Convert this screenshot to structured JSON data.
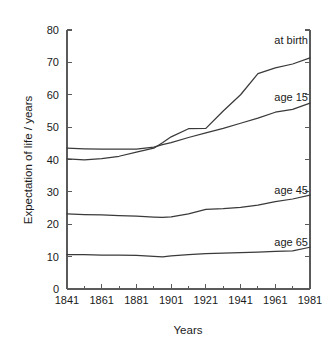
{
  "chart_data": {
    "type": "line",
    "title": "",
    "xlabel": "Years",
    "ylabel": "Expectation of life / years",
    "xlim": [
      1841,
      1981
    ],
    "ylim": [
      0,
      80
    ],
    "grid": false,
    "legend_position": "inline-right",
    "x_ticks": [
      1841,
      1861,
      1881,
      1901,
      1921,
      1941,
      1961,
      1981
    ],
    "x_tick_labels": [
      "1841",
      "1861",
      "1881",
      "1901",
      "1921",
      "1941",
      "1961",
      "1981"
    ],
    "x_minor_ticks": [
      1851,
      1871,
      1891,
      1911,
      1931,
      1951,
      1971
    ],
    "y_ticks": [
      0,
      10,
      20,
      30,
      40,
      50,
      60,
      70,
      80
    ],
    "y_tick_labels": [
      "0",
      "10",
      "20",
      "30",
      "40",
      "50",
      "60",
      "70",
      "80"
    ],
    "x": [
      1841,
      1851,
      1861,
      1871,
      1881,
      1891,
      1896,
      1901,
      1911,
      1921,
      1931,
      1941,
      1951,
      1961,
      1971,
      1981
    ],
    "series": [
      {
        "name": "at birth",
        "label": "at birth",
        "color": "#3a3a3a",
        "values": [
          40.2,
          39.9,
          40.3,
          41.0,
          42.3,
          43.5,
          45.2,
          47.0,
          49.5,
          49.6,
          55.0,
          60.0,
          66.5,
          68.3,
          69.5,
          71.4
        ]
      },
      {
        "name": "age 15",
        "label": "age 15",
        "color": "#3a3a3a",
        "values": [
          43.5,
          43.3,
          43.2,
          43.2,
          43.2,
          43.8,
          44.6,
          45.2,
          46.8,
          48.2,
          49.6,
          51.2,
          52.8,
          54.6,
          55.5,
          57.4
        ]
      },
      {
        "name": "age 45",
        "label": "age 45",
        "color": "#3a3a3a",
        "values": [
          23.2,
          23.0,
          22.9,
          22.7,
          22.5,
          22.2,
          22.1,
          22.3,
          23.2,
          24.6,
          24.8,
          25.2,
          25.9,
          27.0,
          27.8,
          29.0
        ]
      },
      {
        "name": "age 65",
        "label": "age 65",
        "color": "#3a3a3a",
        "values": [
          10.6,
          10.6,
          10.5,
          10.5,
          10.4,
          10.1,
          9.9,
          10.2,
          10.6,
          10.9,
          11.1,
          11.2,
          11.4,
          11.6,
          11.8,
          12.9
        ]
      }
    ],
    "series_label_positions": [
      {
        "name": "at birth",
        "x_px": 308,
        "y_px": 44
      },
      {
        "name": "age 15",
        "x_px": 308,
        "y_px": 101
      },
      {
        "name": "age 45",
        "x_px": 308,
        "y_px": 194
      },
      {
        "name": "age 65",
        "x_px": 308,
        "y_px": 246
      }
    ],
    "axes_colors": {
      "axis": "#5a5a5a",
      "line": "#3a3a3a",
      "background": "#ffffff",
      "text": "#1a1a1a"
    }
  },
  "figure": {
    "plot_left_px": 67,
    "plot_right_px": 310,
    "plot_top_px": 30,
    "plot_bottom_px": 289
  }
}
